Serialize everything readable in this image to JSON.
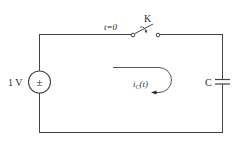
{
  "diagram": {
    "type": "circuit",
    "source": {
      "label": "1 V",
      "symbol": "±"
    },
    "switch": {
      "name": "K",
      "time_label": "t=0"
    },
    "capacitor": {
      "label": "C"
    },
    "current": {
      "symbol": "i",
      "subscript": "C",
      "arg": "(t)"
    }
  },
  "colors": {
    "wire": "#444444",
    "text": "#2a2a2a",
    "background": "#ffffff"
  }
}
